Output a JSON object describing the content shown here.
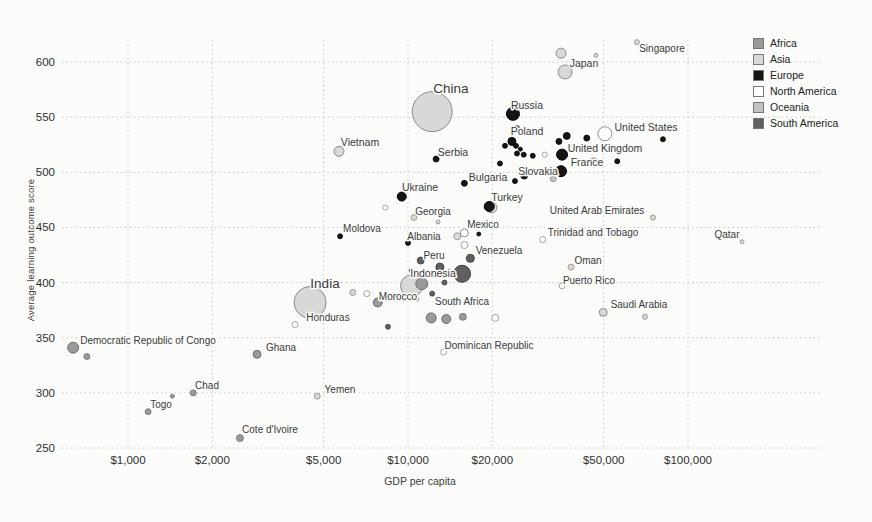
{
  "chart_data": {
    "type": "scatter",
    "title": "",
    "xlabel": "GDP per capita",
    "ylabel": "Average learning outcome score",
    "x_scale": "log",
    "x_ticks": [
      {
        "label": "$1,000",
        "value": 1000
      },
      {
        "label": "$2,000",
        "value": 2000
      },
      {
        "label": "$5,000",
        "value": 5000
      },
      {
        "label": "$10,000",
        "value": 10000
      },
      {
        "label": "$20,000",
        "value": 20000
      },
      {
        "label": "$50,000",
        "value": 50000
      },
      {
        "label": "$100,000",
        "value": 100000
      }
    ],
    "y_ticks": [
      250,
      300,
      350,
      400,
      450,
      500,
      550,
      600
    ],
    "xlim": [
      570,
      280000
    ],
    "ylim": [
      240,
      625
    ],
    "grid": "dotted",
    "legend_position": "right",
    "continent_colors": {
      "Africa": {
        "fill": "#9a9a9a",
        "stroke": "#6f6f6f"
      },
      "Asia": {
        "fill": "#d8d8d6",
        "stroke": "#8c8c8c"
      },
      "Europe": {
        "fill": "#151515",
        "stroke": "#000000"
      },
      "North America": {
        "fill": "#ffffff",
        "stroke": "#8f8f8f"
      },
      "Oceania": {
        "fill": "#c2c2c0",
        "stroke": "#8c8c8c"
      },
      "South America": {
        "fill": "#606060",
        "stroke": "#3d3d3d"
      }
    },
    "legend": [
      {
        "label": "Africa"
      },
      {
        "label": "Asia"
      },
      {
        "label": "Europe"
      },
      {
        "label": "North America"
      },
      {
        "label": "Oceania"
      },
      {
        "label": "South America"
      }
    ],
    "points": [
      {
        "name": "China",
        "continent": "Asia",
        "gdp": 12200,
        "score": 555,
        "r": 20,
        "label": {
          "x": 451,
          "y": 88,
          "size": 13.5
        }
      },
      {
        "name": "India",
        "continent": "Asia",
        "gdp": 4470,
        "score": 382,
        "r": 16,
        "label": {
          "x": 325,
          "y": 283,
          "size": 13.5
        }
      },
      {
        "name": "Indonesia",
        "continent": "Asia",
        "gdp": 10300,
        "score": 397,
        "r": 11,
        "label": {
          "x": 433,
          "y": 273,
          "size": 10.5
        }
      },
      {
        "name": "Japan",
        "continent": "Asia",
        "gdp": 36400,
        "score": 591,
        "r": 7,
        "label": {
          "x": 584,
          "y": 63,
          "size": 10.5
        }
      },
      {
        "name": "Singapore",
        "continent": "Asia",
        "gdp": 65700,
        "score": 618,
        "r": 2.5,
        "label": {
          "x": 662,
          "y": 48,
          "size": 10
        }
      },
      {
        "name": "Russia",
        "continent": "Europe",
        "gdp": 23700,
        "score": 553,
        "r": 6.5,
        "label": {
          "x": 527,
          "y": 105,
          "size": 10.5
        }
      },
      {
        "name": "Vietnam",
        "continent": "Asia",
        "gdp": 5670,
        "score": 519,
        "r": 5,
        "label": {
          "x": 360,
          "y": 142,
          "size": 10.5
        }
      },
      {
        "name": "United States",
        "continent": "North America",
        "gdp": 50500,
        "score": 535,
        "r": 7,
        "label": {
          "x": 646,
          "y": 127,
          "size": 10.5
        }
      },
      {
        "name": "Poland",
        "continent": "Europe",
        "gdp": 23500,
        "score": 528,
        "r": 4,
        "label": {
          "x": 527,
          "y": 131,
          "size": 10.5
        }
      },
      {
        "name": "United Kingdom",
        "continent": "Europe",
        "gdp": 35500,
        "score": 516,
        "r": 5.5,
        "label": {
          "x": 605,
          "y": 148,
          "size": 10.5
        }
      },
      {
        "name": "Serbia",
        "continent": "Europe",
        "gdp": 12600,
        "score": 512,
        "r": 3,
        "label": {
          "x": 453,
          "y": 152,
          "size": 10.5
        }
      },
      {
        "name": "France",
        "continent": "Europe",
        "gdp": 35200,
        "score": 501,
        "r": 5.5,
        "label": {
          "x": 587,
          "y": 162,
          "size": 10.5
        }
      },
      {
        "name": "Slovakia",
        "continent": "Europe",
        "gdp": 26000,
        "score": 497,
        "r": 3.5,
        "label": {
          "x": 538,
          "y": 171,
          "size": 10.5
        }
      },
      {
        "name": "Bulgaria",
        "continent": "Europe",
        "gdp": 15900,
        "score": 490,
        "r": 3,
        "label": {
          "x": 488,
          "y": 177,
          "size": 10.5
        }
      },
      {
        "name": "Ukraine",
        "continent": "Europe",
        "gdp": 9500,
        "score": 478,
        "r": 4.5,
        "label": {
          "x": 420,
          "y": 187,
          "size": 10.5
        }
      },
      {
        "name": "Turkey",
        "continent": "Europe",
        "gdp": 19500,
        "score": 469,
        "r": 5,
        "label": {
          "x": 507,
          "y": 197,
          "size": 10.5
        }
      },
      {
        "name": "Georgia",
        "continent": "Asia",
        "gdp": 10500,
        "score": 459,
        "r": 3,
        "label": {
          "x": 433,
          "y": 211,
          "size": 10
        }
      },
      {
        "name": "Moldova",
        "continent": "Europe",
        "gdp": 5720,
        "score": 442,
        "r": 2.5,
        "label": {
          "x": 362,
          "y": 228,
          "size": 10
        }
      },
      {
        "name": "Albania",
        "continent": "Europe",
        "gdp": 10000,
        "score": 436,
        "r": 2.5,
        "label": {
          "x": 424,
          "y": 236,
          "size": 10
        }
      },
      {
        "name": "Mexico",
        "continent": "North America",
        "gdp": 15900,
        "score": 445,
        "r": 4,
        "label": {
          "x": 483,
          "y": 224,
          "size": 10
        }
      },
      {
        "name": "Venezuela",
        "continent": "South America",
        "gdp": 16700,
        "score": 422,
        "r": 4,
        "label": {
          "x": 499,
          "y": 250,
          "size": 10
        }
      },
      {
        "name": "Peru",
        "continent": "South America",
        "gdp": 11100,
        "score": 420,
        "r": 3.5,
        "label": {
          "x": 434,
          "y": 255,
          "size": 10
        }
      },
      {
        "name": "Morocco",
        "continent": "Africa",
        "gdp": 7800,
        "score": 382,
        "r": 4.5,
        "label": {
          "x": 398,
          "y": 296,
          "size": 10
        }
      },
      {
        "name": "South Africa",
        "continent": "Africa",
        "gdp": 13700,
        "score": 367,
        "r": 4.5,
        "label": {
          "x": 462,
          "y": 301,
          "size": 10
        }
      },
      {
        "name": "Honduras",
        "continent": "North America",
        "gdp": 3950,
        "score": 362,
        "r": 3,
        "label": {
          "x": 328,
          "y": 317,
          "size": 10
        }
      },
      {
        "name": "United Arab Emirates",
        "continent": "Asia",
        "gdp": 75000,
        "score": 459,
        "r": 2.5,
        "label": {
          "x": 597,
          "y": 210,
          "size": 10
        }
      },
      {
        "name": "Trinidad and Tobago",
        "continent": "North America",
        "gdp": 30300,
        "score": 439,
        "r": 3,
        "label": {
          "x": 593,
          "y": 232,
          "size": 10
        }
      },
      {
        "name": "Oman",
        "continent": "Asia",
        "gdp": 38200,
        "score": 414,
        "r": 3,
        "label": {
          "x": 588,
          "y": 260,
          "size": 10
        }
      },
      {
        "name": "Puerto Rico",
        "continent": "North America",
        "gdp": 35500,
        "score": 397,
        "r": 3,
        "label": {
          "x": 589,
          "y": 280,
          "size": 10
        }
      },
      {
        "name": "Saudi Arabia",
        "continent": "Asia",
        "gdp": 49800,
        "score": 373,
        "r": 4,
        "label": {
          "x": 639,
          "y": 304,
          "size": 10
        }
      },
      {
        "name": "Qatar",
        "continent": "Asia",
        "gdp": 156000,
        "score": 437,
        "r": 2,
        "label": {
          "x": 727,
          "y": 234,
          "size": 10
        }
      },
      {
        "name": "Dominican Republic",
        "continent": "North America",
        "gdp": 13400,
        "score": 337,
        "r": 3,
        "label": {
          "x": 489,
          "y": 345,
          "size": 10
        }
      },
      {
        "name": "Democratic Republic of Congo",
        "continent": "Africa",
        "gdp": 637,
        "score": 341,
        "r": 5.5,
        "label": {
          "x": 148,
          "y": 340,
          "size": 10
        }
      },
      {
        "name": "Ghana",
        "continent": "Africa",
        "gdp": 2890,
        "score": 335,
        "r": 4,
        "label": {
          "x": 281,
          "y": 347,
          "size": 10
        }
      },
      {
        "name": "Chad",
        "continent": "Africa",
        "gdp": 1710,
        "score": 300,
        "r": 3,
        "label": {
          "x": 207,
          "y": 385,
          "size": 10
        }
      },
      {
        "name": "Togo",
        "continent": "Africa",
        "gdp": 1180,
        "score": 283,
        "r": 3,
        "label": {
          "x": 161,
          "y": 404,
          "size": 10
        }
      },
      {
        "name": "Yemen",
        "continent": "Asia",
        "gdp": 4740,
        "score": 297,
        "r": 3,
        "label": {
          "x": 340,
          "y": 389,
          "size": 10
        }
      },
      {
        "name": "Cote d'Ivoire",
        "continent": "Africa",
        "gdp": 2510,
        "score": 259,
        "r": 3.5,
        "label": {
          "x": 270,
          "y": 429,
          "size": 10
        }
      },
      {
        "continent": "Asia",
        "gdp": 35200,
        "score": 608,
        "r": 5
      },
      {
        "continent": "Asia",
        "gdp": 46900,
        "score": 606,
        "r": 2
      },
      {
        "continent": "Europe",
        "gdp": 24500,
        "score": 540,
        "r": 2.5
      },
      {
        "continent": "Europe",
        "gdp": 22200,
        "score": 524,
        "r": 2.5
      },
      {
        "continent": "Europe",
        "gdp": 24300,
        "score": 524,
        "r": 2.5
      },
      {
        "continent": "Europe",
        "gdp": 25200,
        "score": 521,
        "r": 2
      },
      {
        "continent": "Europe",
        "gdp": 24500,
        "score": 517,
        "r": 2.5
      },
      {
        "continent": "Europe",
        "gdp": 25900,
        "score": 516,
        "r": 2.5
      },
      {
        "continent": "Europe",
        "gdp": 27900,
        "score": 515,
        "r": 2.5
      },
      {
        "continent": "North America",
        "gdp": 30800,
        "score": 516,
        "r": 2.5
      },
      {
        "continent": "Europe",
        "gdp": 34600,
        "score": 528,
        "r": 3
      },
      {
        "continent": "Europe",
        "gdp": 36900,
        "score": 533,
        "r": 3.5
      },
      {
        "continent": "Europe",
        "gdp": 43500,
        "score": 531,
        "r": 3
      },
      {
        "continent": "Europe",
        "gdp": 81400,
        "score": 530,
        "r": 2.5
      },
      {
        "continent": "Europe",
        "gdp": 55900,
        "score": 510,
        "r": 2.5
      },
      {
        "continent": "Oceania",
        "gdp": 46100,
        "score": 509,
        "r": 4.5
      },
      {
        "continent": "Oceania",
        "gdp": 33000,
        "score": 494,
        "r": 3
      },
      {
        "continent": "Europe",
        "gdp": 21300,
        "score": 508,
        "r": 2.5
      },
      {
        "continent": "Europe",
        "gdp": 24100,
        "score": 492,
        "r": 2.5
      },
      {
        "continent": "Asia",
        "gdp": 19900,
        "score": 468,
        "r": 5.3
      },
      {
        "continent": "North America",
        "gdp": 8300,
        "score": 468,
        "r": 2.5
      },
      {
        "continent": "Asia",
        "gdp": 12800,
        "score": 455,
        "r": 2
      },
      {
        "continent": "Europe",
        "gdp": 17900,
        "score": 444,
        "r": 2
      },
      {
        "continent": "Asia",
        "gdp": 15000,
        "score": 442,
        "r": 3.5
      },
      {
        "continent": "North America",
        "gdp": 15900,
        "score": 434,
        "r": 3.5
      },
      {
        "continent": "South America",
        "gdp": 13000,
        "score": 414,
        "r": 4
      },
      {
        "continent": "South America",
        "gdp": 10260,
        "score": 411,
        "r": 2
      },
      {
        "continent": "South America",
        "gdp": 15600,
        "score": 408,
        "r": 8.5
      },
      {
        "continent": "Africa",
        "gdp": 11200,
        "score": 399,
        "r": 6
      },
      {
        "continent": "South America",
        "gdp": 13500,
        "score": 400,
        "r": 2.5
      },
      {
        "continent": "Asia",
        "gdp": 10760,
        "score": 385,
        "r": 2
      },
      {
        "continent": "North America",
        "gdp": 7130,
        "score": 390,
        "r": 3
      },
      {
        "continent": "Asia",
        "gdp": 6350,
        "score": 391,
        "r": 3
      },
      {
        "continent": "South America",
        "gdp": 12200,
        "score": 390,
        "r": 2.5
      },
      {
        "continent": "Africa",
        "gdp": 12100,
        "score": 368,
        "r": 5
      },
      {
        "continent": "Africa",
        "gdp": 15700,
        "score": 369,
        "r": 3.5
      },
      {
        "continent": "South America",
        "gdp": 8480,
        "score": 360,
        "r": 2.5
      },
      {
        "continent": "North America",
        "gdp": 20500,
        "score": 368,
        "r": 3.5
      },
      {
        "continent": "Asia",
        "gdp": 70200,
        "score": 369,
        "r": 2.5
      },
      {
        "continent": "North America",
        "gdp": 38200,
        "score": 449,
        "r": 2
      },
      {
        "continent": "Africa",
        "gdp": 713,
        "score": 333,
        "r": 3
      },
      {
        "continent": "Africa",
        "gdp": 1440,
        "score": 297,
        "r": 2
      }
    ]
  }
}
